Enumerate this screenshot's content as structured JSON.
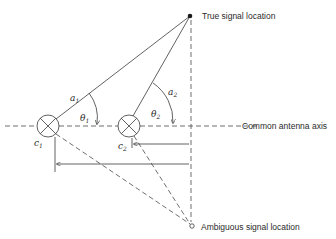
{
  "diagram": {
    "labels": {
      "true_signal": "True signal location",
      "ambiguous_signal": "Ambiguous signal location",
      "axis": "Common antenna axis"
    },
    "symbols": {
      "a1": "a",
      "a1_sub": "1",
      "a2": "a",
      "a2_sub": "2",
      "theta1": "θ",
      "theta1_sub": "1",
      "theta2": "θ",
      "theta2_sub": "2",
      "c1": "c",
      "c1_sub": "1",
      "c2": "c",
      "c2_sub": "2"
    },
    "colors": {
      "line": "#3a3a3a",
      "background": "#ffffff"
    }
  }
}
